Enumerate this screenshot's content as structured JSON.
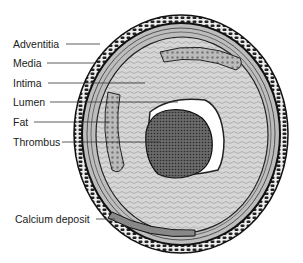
{
  "diagram": {
    "type": "cross-section illustration",
    "labels": [
      {
        "id": "adventitia",
        "text": "Adventitia",
        "x": 13,
        "y": 38,
        "line_end_x": 100,
        "line_y": 44
      },
      {
        "id": "media",
        "text": "Media",
        "x": 13,
        "y": 57,
        "line_end_x": 95,
        "line_y": 63
      },
      {
        "id": "intima",
        "text": "Intima",
        "x": 13,
        "y": 77,
        "line_end_x": 145,
        "line_y": 83
      },
      {
        "id": "lumen",
        "text": "Lumen",
        "x": 13,
        "y": 96,
        "line_end_x": 178,
        "line_y": 102
      },
      {
        "id": "fat",
        "text": "Fat",
        "x": 13,
        "y": 116,
        "line_end_x": 110,
        "line_y": 122
      },
      {
        "id": "thrombus",
        "text": "Thrombus",
        "x": 13,
        "y": 136,
        "line_end_x": 160,
        "line_y": 142
      },
      {
        "id": "calcium_deposit",
        "text": "Calcium deposit",
        "x": 15,
        "y": 213,
        "line_end_x": 115,
        "line_y": 219
      }
    ],
    "colors": {
      "ink": "#222222",
      "wall_gray": "#c8c8c8",
      "intima_gray": "#dcdcdc",
      "thrombus": "#555555",
      "lumen": "#ffffff",
      "fat": "#a0a0a0"
    }
  }
}
